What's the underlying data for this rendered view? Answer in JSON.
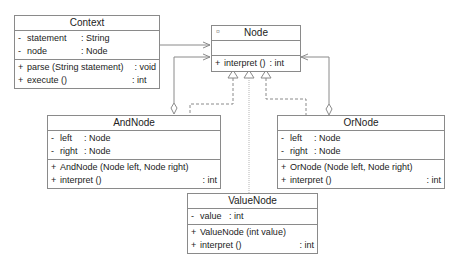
{
  "diagram": {
    "type": "UML class diagram",
    "pattern": "Interpreter",
    "classes": {
      "context": {
        "name": "Context",
        "attributes": [
          {
            "vis": "-",
            "name": "statement",
            "type": ": String"
          },
          {
            "vis": "-",
            "name": "node",
            "type": ": Node"
          }
        ],
        "operations": [
          {
            "vis": "+",
            "name": "parse (String statement)",
            "type": ": void"
          },
          {
            "vis": "+",
            "name": "execute ()",
            "type": ": int"
          }
        ]
      },
      "node": {
        "name": "Node",
        "stereotype_glyph": "¤",
        "attributes": [],
        "operations": [
          {
            "vis": "+",
            "name": "interpret ()",
            "type": ": int"
          }
        ]
      },
      "andnode": {
        "name": "AndNode",
        "attributes": [
          {
            "vis": "-",
            "name": "left",
            "type": ": Node"
          },
          {
            "vis": "-",
            "name": "right",
            "type": ": Node"
          }
        ],
        "operations": [
          {
            "vis": "+",
            "name": "AndNode (Node left, Node right)",
            "type": ""
          },
          {
            "vis": "+",
            "name": "interpret ()",
            "type": ": int"
          }
        ]
      },
      "ornode": {
        "name": "OrNode",
        "attributes": [
          {
            "vis": "-",
            "name": "left",
            "type": ": Node"
          },
          {
            "vis": "-",
            "name": "right",
            "type": ": Node"
          }
        ],
        "operations": [
          {
            "vis": "+",
            "name": "OrNode (Node left, Node right)",
            "type": ""
          },
          {
            "vis": "+",
            "name": "interpret ()",
            "type": ": int"
          }
        ]
      },
      "valuenode": {
        "name": "ValueNode",
        "attributes": [
          {
            "vis": "-",
            "name": "value",
            "type": ": int"
          }
        ],
        "operations": [
          {
            "vis": "+",
            "name": "ValueNode (int value)",
            "type": ""
          },
          {
            "vis": "+",
            "name": "interpret ()",
            "type": ": int"
          }
        ]
      }
    },
    "relationships": [
      {
        "from": "Context",
        "to": "Node",
        "kind": "association"
      },
      {
        "from": "AndNode",
        "to": "Node",
        "kind": "aggregation"
      },
      {
        "from": "OrNode",
        "to": "Node",
        "kind": "aggregation"
      },
      {
        "from": "AndNode",
        "to": "Node",
        "kind": "realization"
      },
      {
        "from": "ValueNode",
        "to": "Node",
        "kind": "realization"
      },
      {
        "from": "OrNode",
        "to": "Node",
        "kind": "realization"
      }
    ],
    "colors": {
      "line": "#8a8a8a",
      "text": "#222222",
      "background": "#ffffff"
    }
  }
}
